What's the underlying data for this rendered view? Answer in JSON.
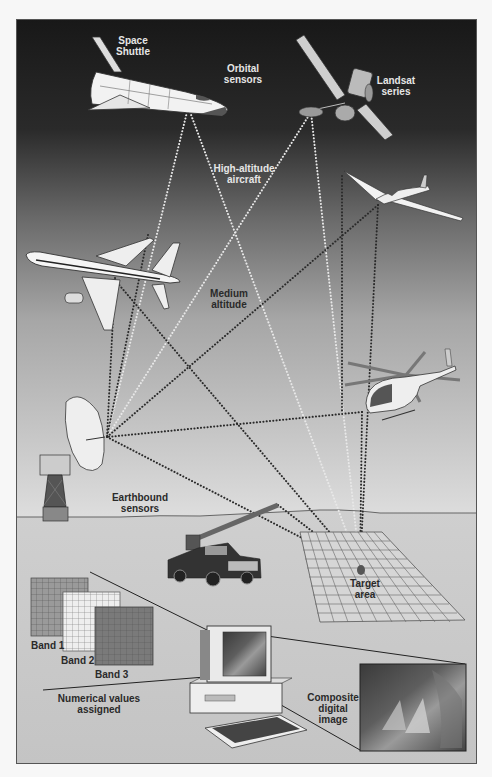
{
  "diagram": {
    "colors": {
      "sky_top": "#1b1b1b",
      "sky_mid": "#5a5a5a",
      "sky_bottom": "#dcdcdc",
      "ground": "#c9c9c9",
      "frame_border": "#555555",
      "label_light": "#e6e6e6",
      "label_dark": "#2a2a2a",
      "sensor_path": "#222222",
      "sensor_path_light": "#e8e8e8"
    },
    "labels": {
      "space_shuttle": {
        "line1": "Space",
        "line2": "Shuttle"
      },
      "orbital_sensors": {
        "line1": "Orbital",
        "line2": "sensors"
      },
      "landsat_series": {
        "line1": "Landsat",
        "line2": "series"
      },
      "high_altitude_aircraft": {
        "line1": "High-altitude",
        "line2": "aircraft"
      },
      "medium_altitude": {
        "line1": "Medium",
        "line2": "altitude"
      },
      "earthbound_sensors": {
        "line1": "Earthbound",
        "line2": "sensors"
      },
      "target_area": {
        "line1": "Target",
        "line2": "area"
      },
      "band_1": "Band 1",
      "band_2": "Band 2",
      "band_3": "Band 3",
      "numerical_values_assigned": {
        "line1": "Numerical values",
        "line2": "assigned"
      },
      "composite_digital_image": {
        "line1": "Composite",
        "line2": "digital",
        "line3": "image"
      }
    },
    "platforms": [
      {
        "id": "space-shuttle",
        "category": "Orbital sensors"
      },
      {
        "id": "landsat-satellite",
        "category": "Orbital sensors"
      },
      {
        "id": "glider-aircraft",
        "category": "High-altitude aircraft"
      },
      {
        "id": "airliner",
        "category": "Medium altitude"
      },
      {
        "id": "helicopter",
        "category": "Medium altitude"
      },
      {
        "id": "radar-dish",
        "category": "Earthbound sensors"
      },
      {
        "id": "bucket-truck",
        "category": "Earthbound sensors"
      }
    ],
    "bands": [
      "Band 1",
      "Band 2",
      "Band 3"
    ]
  }
}
